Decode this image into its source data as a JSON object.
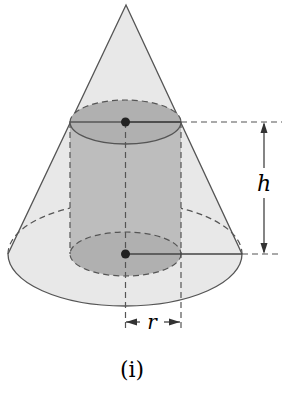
{
  "figure": {
    "caption": "(i)",
    "labels": {
      "height": "h",
      "radius": "r"
    },
    "colors": {
      "cone_fill": "#e8e8e8",
      "cylinder_fill": "#b8b8b8",
      "stroke": "#555555",
      "dot": "#222222"
    }
  }
}
